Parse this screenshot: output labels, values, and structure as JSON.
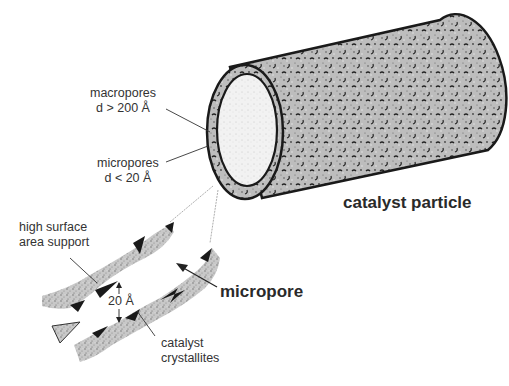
{
  "figure": {
    "labels": {
      "macropores": {
        "line1": "macropores",
        "line2": "d > 200 Å"
      },
      "micropores": {
        "line1": "micropores",
        "line2": "d < 20 Å"
      },
      "support": {
        "line1": "high surface",
        "line2": "area support"
      },
      "gap": "20 Å",
      "crystallites": {
        "line1": "catalyst",
        "line2": "crystallites"
      },
      "micropore": "micropore",
      "particle": "catalyst particle"
    },
    "colors": {
      "outline": "#1a1a1a",
      "texture": "#8a8a8a",
      "inner_face": "#e8e8e8",
      "text": "#2a2a2a"
    }
  }
}
